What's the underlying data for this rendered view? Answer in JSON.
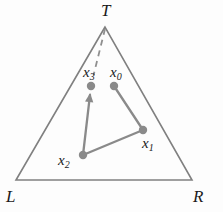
{
  "figure": {
    "type": "simplex-diagram",
    "width": 223,
    "height": 212,
    "background_color": "#fdfdfd",
    "stroke_color": "#808080",
    "point_color": "#8a8a8a",
    "label_color": "#1a1a1a"
  },
  "vertices": [
    {
      "name": "top-vertex",
      "label": "T",
      "x": 105,
      "y": 27,
      "label_x": 101,
      "label_y": 2
    },
    {
      "name": "bottom-left-vertex",
      "label": "L",
      "x": 16,
      "y": 180,
      "label_x": 6,
      "label_y": 188
    },
    {
      "name": "bottom-right-vertex",
      "label": "R",
      "x": 192,
      "y": 180,
      "label_x": 193,
      "label_y": 188
    }
  ],
  "points": [
    {
      "name": "point-x0",
      "label": "x",
      "subscript": "0",
      "x": 114,
      "y": 86,
      "label_x": 110,
      "label_y": 65
    },
    {
      "name": "point-x1",
      "label": "x",
      "subscript": "1",
      "x": 143,
      "y": 130,
      "label_x": 142,
      "label_y": 136
    },
    {
      "name": "point-x2",
      "label": "x",
      "subscript": "2",
      "x": 83,
      "y": 155,
      "label_x": 58,
      "label_y": 153
    },
    {
      "name": "point-x3",
      "label": "x",
      "subscript": "3",
      "x": 91,
      "y": 86,
      "label_x": 83,
      "label_y": 65
    }
  ],
  "chart_data": {
    "type": "scatter",
    "title": "",
    "xlabel": "",
    "ylabel": "",
    "triangle_vertices": [
      {
        "label": "T",
        "x": 105,
        "y": 27
      },
      {
        "label": "L",
        "x": 16,
        "y": 180
      },
      {
        "label": "R",
        "x": 192,
        "y": 180
      }
    ],
    "series": [
      {
        "name": "iterates",
        "points": [
          {
            "label": "x0",
            "x": 114,
            "y": 86
          },
          {
            "label": "x1",
            "x": 143,
            "y": 130
          },
          {
            "label": "x2",
            "x": 83,
            "y": 155
          },
          {
            "label": "x3",
            "x": 91,
            "y": 86
          }
        ]
      }
    ],
    "solid_path": [
      {
        "from": "x0",
        "to": "x1"
      },
      {
        "from": "x1",
        "to": "x2"
      },
      {
        "from": "x2",
        "to": "x3"
      }
    ],
    "arrow_segments": [
      {
        "from": "x2",
        "to": "x3",
        "head_at": "x3"
      }
    ],
    "dashed_segments": [
      {
        "from": "T",
        "to": "x3"
      }
    ],
    "grid": false,
    "legend": "none"
  }
}
